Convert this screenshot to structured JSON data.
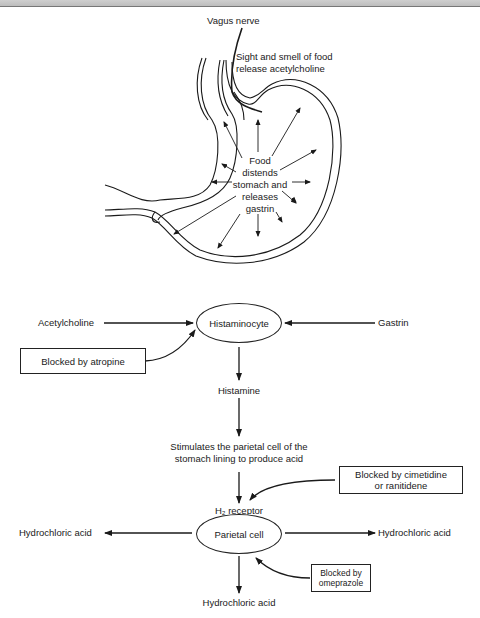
{
  "stomach": {
    "vagus_label": "Vagus nerve",
    "sight_smell_line1": "Sight and smell of food",
    "sight_smell_line2": "release acetylcholine",
    "food_lines": [
      "Food",
      "distends",
      "stomach and",
      "releases",
      "gastrin"
    ]
  },
  "flow": {
    "acetylcholine": "Acetylcholine",
    "histaminocyte": "Histaminocyte",
    "gastrin": "Gastrin",
    "blocked_atropine": "Blocked by atropine",
    "histamine": "Histamine",
    "stimulates_line1": "Stimulates the parietal cell of the",
    "stimulates_line2": "stomach lining to produce acid",
    "blocked_cimetidine_line1": "Blocked by cimetidine",
    "blocked_cimetidine_line2": "or ranitidene",
    "h2_receptor": "H₂ receptor",
    "parietal_cell": "Parietal cell",
    "hcl_left": "Hydrochloric acid",
    "hcl_right": "Hydrochloric acid",
    "hcl_bottom": "Hydrochloric acid",
    "blocked_omeprazole_line1": "Blocked by",
    "blocked_omeprazole_line2": "omeprazole"
  }
}
